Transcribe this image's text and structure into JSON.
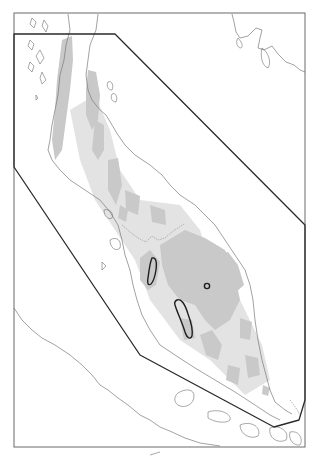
{
  "map": {
    "type": "distribution-map",
    "region_label": "Malay Peninsula",
    "colors": {
      "background": "#ffffff",
      "highland": "#c9c9c9",
      "highland_light": "#e3e3e3",
      "coastline": "#7a7a7a",
      "frame": "#6a6a6a",
      "study_polygon": "#2a2a2a",
      "range_outline": "#1e1e1e"
    },
    "frame": {
      "x": 14,
      "y": 13,
      "width": 291,
      "height": 434
    },
    "study_polygon": "14,34 115,34 305,225 305,400 299,420 274,427 140,355 14,167",
    "range_outlines": [
      {
        "id": "range-northwest",
        "path": "M152,258 C156,257 157,262 156,270 C155,276 153,282 151,284 C148,286 147,283 148,278 C149,270 150,262 152,258 Z"
      },
      {
        "id": "range-south",
        "path": "M177,300 C181,298 185,304 188,314 C191,322 193,330 192,336 C190,340 187,338 185,332 C182,322 177,312 175,305 C174,302 175,301 177,300 Z"
      },
      {
        "id": "range-east-point",
        "cx": 207,
        "cy": 286,
        "r": 2.6
      }
    ]
  },
  "caption": ""
}
